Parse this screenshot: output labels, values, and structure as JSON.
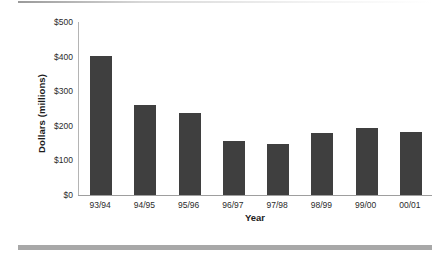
{
  "chart_data": {
    "type": "bar",
    "title": "",
    "subtitle": "",
    "xlabel": "Year",
    "ylabel": "Dollars (millions)",
    "categories": [
      "93/94",
      "94/95",
      "95/96",
      "96/97",
      "97/98",
      "98/99",
      "99/00",
      "00/01"
    ],
    "values": [
      402,
      260,
      237,
      157,
      146,
      180,
      195,
      182
    ],
    "series": [
      {
        "name": "Dollars (millions)",
        "values": [
          402,
          260,
          237,
          157,
          146,
          180,
          195,
          182
        ]
      }
    ],
    "ylim": [
      0,
      500
    ],
    "ytick_values": [
      0,
      100,
      200,
      300,
      400,
      500
    ],
    "ytick_labels": [
      "$0",
      "$100",
      "$200",
      "$300",
      "$400",
      "$500"
    ],
    "grid": false,
    "legend": null,
    "legend_position": "none",
    "bar_color": "#3f3f3f",
    "axis_color": "#9e9e9e",
    "background_color": "#ffffff",
    "annotations": []
  },
  "decor": {
    "top_rule_name": "top-divider-rule",
    "bottom_rule_name": "bottom-divider-rule"
  }
}
